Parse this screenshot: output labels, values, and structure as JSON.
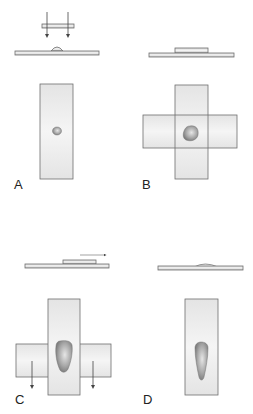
{
  "figure": {
    "panels": [
      {
        "id": "A",
        "label": "A",
        "step": "coverslip lowered onto drop on slide"
      },
      {
        "id": "B",
        "label": "B",
        "step": "coverslip placed crosswise on slide, drop spreads"
      },
      {
        "id": "C",
        "label": "C",
        "step": "coverslip slid along slide, ends pulled down"
      },
      {
        "id": "D",
        "label": "D",
        "step": "resulting smear on slide"
      }
    ]
  },
  "colors": {
    "slide_fill": "#ececec",
    "slide_stroke": "#6e6e6e",
    "drop_fill": "#9a9a9a",
    "arrow": "#444444",
    "label": "#222222"
  }
}
